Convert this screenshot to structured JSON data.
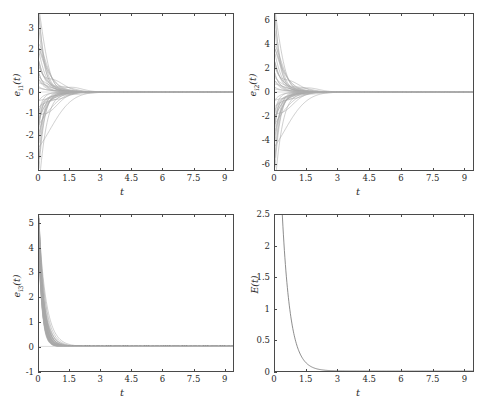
{
  "figure": {
    "background": "#ffffff",
    "axis_color": "#4a4a4a",
    "curve_color": "#7a7a7a",
    "bundle_color": "#8c8c8c",
    "single_curve_color": "#6e6e6e"
  },
  "panels": [
    {
      "id": "panel-e1",
      "ylabel_var": "e",
      "ylabel_sub": "i1",
      "ylabel_tail": "(t)",
      "xlabel": "t",
      "yticks": [
        "-3",
        "-2",
        "-1",
        "0",
        "1",
        "2",
        "3"
      ],
      "xticks": [
        "0",
        "1.5",
        "3",
        "4.5",
        "6",
        "7.5",
        "9"
      ]
    },
    {
      "id": "panel-e2",
      "ylabel_var": "e",
      "ylabel_sub": "i2",
      "ylabel_tail": "(t)",
      "xlabel": "t",
      "yticks": [
        "-6",
        "-4",
        "-2",
        "0",
        "2",
        "4",
        "6"
      ],
      "xticks": [
        "0",
        "1.5",
        "3",
        "4.5",
        "6",
        "7.5",
        "9"
      ]
    },
    {
      "id": "panel-e3",
      "ylabel_var": "e",
      "ylabel_sub": "i3",
      "ylabel_tail": "(t)",
      "xlabel": "t",
      "yticks": [
        "-1",
        "0",
        "1",
        "2",
        "3",
        "4",
        "5"
      ],
      "xticks": [
        "0",
        "1.5",
        "3",
        "4.5",
        "6",
        "7.5",
        "9"
      ]
    },
    {
      "id": "panel-E",
      "ylabel_var": "E",
      "ylabel_sub": "",
      "ylabel_tail": "(t)",
      "xlabel": "t",
      "yticks": [
        "0",
        "0.5",
        "1",
        "1.5",
        "2",
        "2.5"
      ],
      "xticks": [
        "0",
        "1.5",
        "3",
        "4.5",
        "6",
        "7.5",
        "9"
      ]
    }
  ],
  "chart_data": [
    {
      "type": "line",
      "title": "",
      "xlabel": "t",
      "ylabel": "e_i1(t)",
      "xlim": [
        0,
        9.45
      ],
      "ylim": [
        -3.7,
        3.7
      ],
      "grid": false,
      "legend": "none",
      "description": "Bundle of ~40 error trajectories, symmetric about zero, decaying exponentially to 0 by t approximately 3 and remaining flat thereafter.",
      "n_series": 40,
      "decay_rate": 2.2,
      "settling_time": 3.0,
      "initial_spread": [
        -3.7,
        3.7
      ],
      "final_value": 0
    },
    {
      "type": "line",
      "title": "",
      "xlabel": "t",
      "ylabel": "e_i2(t)",
      "xlim": [
        0,
        9.45
      ],
      "ylim": [
        -6.6,
        6.6
      ],
      "grid": false,
      "legend": "none",
      "description": "Bundle of ~40 error trajectories, symmetric about zero, decaying exponentially to 0 by t approximately 3.",
      "n_series": 40,
      "decay_rate": 2.3,
      "settling_time": 3.0,
      "initial_spread": [
        -6.6,
        6.6
      ],
      "final_value": 0
    },
    {
      "type": "line",
      "title": "",
      "xlabel": "t",
      "ylabel": "e_i3(t)",
      "xlim": [
        0,
        9.45
      ],
      "ylim": [
        -1.0,
        5.35
      ],
      "grid": false,
      "legend": "none",
      "description": "Bundle of ~40 strictly positive error trajectories starting near 5.3 and decaying sharply to 0 by t approximately 2.",
      "n_series": 40,
      "decay_rate": 3.4,
      "settling_time": 2.0,
      "initial_spread": [
        3.6,
        5.35
      ],
      "final_value": 0
    },
    {
      "type": "line",
      "title": "",
      "xlabel": "t",
      "ylabel": "E(t)",
      "xlim": [
        0,
        9.45
      ],
      "ylim": [
        0,
        2.5
      ],
      "grid": false,
      "legend": "none",
      "description": "Single smooth monotonically decreasing energy curve starting above 2.5 and decaying to 0 near t = 2.",
      "n_series": 1,
      "decay_rate": 2.6,
      "settling_time": 2.0,
      "initial_value": 2.5,
      "final_value": 0
    }
  ]
}
